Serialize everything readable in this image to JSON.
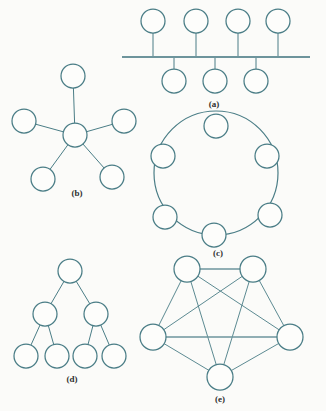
{
  "figure": {
    "background_color": "#fbfbf9",
    "node_stroke_color": "#4a7d86",
    "node_fill_color": "#fdfdfb",
    "link_color": "#4a7d86",
    "bus_line_color": "#6d949c",
    "caption_color": "#2f2f2f"
  },
  "panels": [
    {
      "id": "a",
      "caption": "(a)",
      "topology": "bus",
      "caption_x": 214,
      "caption_y": 107,
      "node_radius": 12,
      "bus": {
        "x1": 122,
        "x2": 310,
        "y": 57
      },
      "nodes_above": [
        {
          "cx": 153,
          "cy": 21
        },
        {
          "cx": 196,
          "cy": 21
        },
        {
          "cx": 238,
          "cy": 21
        },
        {
          "cx": 278,
          "cy": 21
        }
      ],
      "nodes_below": [
        {
          "cx": 174,
          "cy": 81
        },
        {
          "cx": 215,
          "cy": 81
        },
        {
          "cx": 256,
          "cy": 81
        }
      ]
    },
    {
      "id": "b",
      "caption": "(b)",
      "topology": "star",
      "caption_x": 77,
      "caption_y": 196,
      "node_radius": 12,
      "hub": {
        "cx": 75,
        "cy": 135
      },
      "leaves": [
        {
          "cx": 73,
          "cy": 76
        },
        {
          "cx": 24,
          "cy": 121
        },
        {
          "cx": 124,
          "cy": 121
        },
        {
          "cx": 43,
          "cy": 179
        },
        {
          "cx": 112,
          "cy": 177
        }
      ]
    },
    {
      "id": "c",
      "caption": "(c)",
      "topology": "ring",
      "caption_x": 218,
      "caption_y": 256,
      "node_radius": 12,
      "ring": {
        "cx": 216,
        "cy": 173,
        "rx": 62,
        "ry": 62
      },
      "nodes": [
        {
          "cx": 216,
          "cy": 126
        },
        {
          "cx": 267,
          "cy": 156
        },
        {
          "cx": 270,
          "cy": 215
        },
        {
          "cx": 214,
          "cy": 235
        },
        {
          "cx": 165,
          "cy": 217
        },
        {
          "cx": 163,
          "cy": 156
        }
      ]
    },
    {
      "id": "d",
      "caption": "(d)",
      "topology": "tree",
      "caption_x": 72,
      "caption_y": 382,
      "node_radius": 12,
      "root": {
        "cx": 70,
        "cy": 271
      },
      "level2": [
        {
          "cx": 45,
          "cy": 314
        },
        {
          "cx": 96,
          "cy": 314
        }
      ],
      "leaves": [
        {
          "cx": 26,
          "cy": 356
        },
        {
          "cx": 57,
          "cy": 356
        },
        {
          "cx": 85,
          "cy": 356
        },
        {
          "cx": 114,
          "cy": 356
        }
      ]
    },
    {
      "id": "e",
      "caption": "(e)",
      "topology": "mesh",
      "caption_x": 220,
      "caption_y": 402,
      "node_radius": 13,
      "nodes": [
        {
          "cx": 187,
          "cy": 269
        },
        {
          "cx": 253,
          "cy": 269
        },
        {
          "cx": 153,
          "cy": 337
        },
        {
          "cx": 290,
          "cy": 337
        },
        {
          "cx": 220,
          "cy": 377
        }
      ],
      "fully_connected": true
    }
  ]
}
